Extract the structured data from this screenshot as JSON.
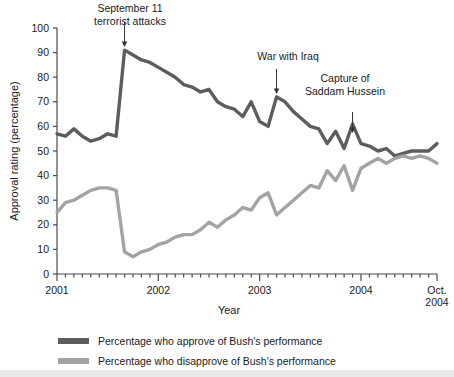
{
  "chart_data": {
    "type": "line",
    "title": "",
    "xlabel": "Year",
    "ylabel": "Approval rating (percentage)",
    "ylim": [
      0,
      100
    ],
    "ytick_values": [
      0,
      10,
      20,
      30,
      40,
      50,
      60,
      70,
      80,
      90,
      100
    ],
    "ytick_labels": [
      "0",
      "10",
      "20",
      "30",
      "40",
      "50",
      "60",
      "70",
      "80",
      "90",
      "100"
    ],
    "xlim": [
      "2001-01",
      "2004-10"
    ],
    "xtick_labels": [
      "2001",
      "2002",
      "2003",
      "2004",
      "Oct.\n2004"
    ],
    "xtick_major": [
      "2001-01",
      "2002-01",
      "2003-01",
      "2004-01",
      "2004-10"
    ],
    "minor_ticks": "monthly",
    "grid": false,
    "legend_position": "below-axes",
    "x": [
      "2001-01",
      "2001-02",
      "2001-03",
      "2001-04",
      "2001-05",
      "2001-06",
      "2001-07",
      "2001-08",
      "2001-09",
      "2001-10",
      "2001-11",
      "2001-12",
      "2002-01",
      "2002-02",
      "2002-03",
      "2002-04",
      "2002-05",
      "2002-06",
      "2002-07",
      "2002-08",
      "2002-09",
      "2002-10",
      "2002-11",
      "2002-12",
      "2003-01",
      "2003-02",
      "2003-03",
      "2003-04",
      "2003-05",
      "2003-06",
      "2003-07",
      "2003-08",
      "2003-09",
      "2003-10",
      "2003-11",
      "2003-12",
      "2004-01",
      "2004-02",
      "2004-03",
      "2004-04",
      "2004-05",
      "2004-06",
      "2004-07",
      "2004-08",
      "2004-09",
      "2004-10"
    ],
    "series": [
      {
        "name": "Percentage who approve of Bush's performance",
        "color": "#5d5d5d",
        "values": [
          57,
          56,
          59,
          56,
          54,
          55,
          57,
          56,
          91,
          89,
          87,
          86,
          84,
          82,
          80,
          77,
          76,
          74,
          75,
          70,
          68,
          67,
          64,
          70,
          62,
          60,
          72,
          70,
          66,
          63,
          60,
          59,
          53,
          58,
          51,
          61,
          53,
          52,
          50,
          51,
          48,
          49,
          50,
          50,
          50,
          53
        ]
      },
      {
        "name": "Percentage who disapprove of Bush's performance",
        "color": "#a3a3a3",
        "values": [
          25,
          29,
          30,
          32,
          34,
          35,
          35,
          34,
          9,
          7,
          9,
          10,
          12,
          13,
          15,
          16,
          16,
          18,
          21,
          19,
          22,
          24,
          27,
          26,
          31,
          33,
          24,
          27,
          30,
          33,
          36,
          35,
          42,
          38,
          44,
          34,
          43,
          45,
          47,
          45,
          47,
          48,
          47,
          48,
          47,
          45
        ]
      }
    ],
    "annotations": [
      {
        "label_lines": [
          "September 11",
          "terrorist attacks"
        ],
        "at_x": "2001-09",
        "arrow": "down"
      },
      {
        "label_lines": [
          "War with Iraq"
        ],
        "at_x": "2003-03",
        "arrow": "down"
      },
      {
        "label_lines": [
          "Capture of",
          "Saddam Hussein"
        ],
        "at_x": "2003-12",
        "arrow": "down"
      }
    ]
  },
  "axes": {
    "ylabel": "Approval rating (percentage)",
    "xlabel": "Year",
    "ytick_labels": [
      "100",
      "90",
      "80",
      "70",
      "60",
      "50",
      "40",
      "30",
      "20",
      "10",
      "0"
    ],
    "xtick_labels": [
      "2001",
      "2002",
      "2003",
      "2004"
    ],
    "xtick_last_line1": "Oct.",
    "xtick_last_line2": "2004"
  },
  "annotations": {
    "sept11": {
      "line1": "September 11",
      "line2": "terrorist attacks"
    },
    "iraq": {
      "line1": "War with Iraq"
    },
    "saddam": {
      "line1": "Capture of",
      "line2": "Saddam Hussein"
    }
  },
  "legend": {
    "items": [
      {
        "label": "Percentage who approve of Bush's performance",
        "color": "#5d5d5d"
      },
      {
        "label": "Percentage who disapprove of Bush's performance",
        "color": "#a3a3a3"
      }
    ]
  },
  "colors": {
    "approve": "#5d5d5d",
    "disapprove": "#a3a3a3",
    "axis": "#4a4a4a",
    "text": "#1a1a1a",
    "background": "#ffffff"
  }
}
